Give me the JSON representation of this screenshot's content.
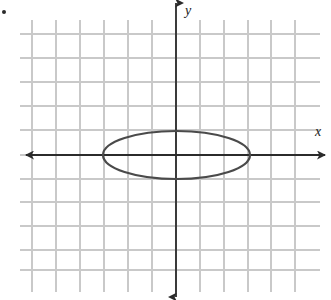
{
  "figure": {
    "kind": "coordinate-plane-with-conic",
    "bullet_marker": "•",
    "axis_labels": {
      "x": "x",
      "y": "y"
    },
    "colors": {
      "grid": "#c9c9c9",
      "axis": "#2b2b2b",
      "curve": "#4a4a4a",
      "background": "#ffffff",
      "label": "#1a1a1a"
    }
  },
  "chart_data": {
    "type": "scatter",
    "title": "",
    "subtitle": "",
    "xlabel": "x",
    "ylabel": "y",
    "grid": true,
    "legend": null,
    "grid_spacing_units": 1,
    "grid_spacing_px": 24,
    "origin_px": {
      "x": 176,
      "y": 155
    },
    "xlim": [
      -6,
      5
    ],
    "ylim": [
      -5,
      5
    ],
    "xticks": [
      -6,
      -5,
      -4,
      -3,
      -2,
      -1,
      0,
      1,
      2,
      3,
      4,
      5
    ],
    "yticks": [
      -5,
      -4,
      -3,
      -2,
      -1,
      0,
      1,
      2,
      3,
      4,
      5
    ],
    "xtick_labels": [],
    "ytick_labels": [],
    "axes": {
      "x_axis": {
        "y_px": 155,
        "x_start_px": 26,
        "x_end_px": 325,
        "arrows": "both"
      },
      "y_axis": {
        "x_px": 176,
        "y_start_px": 3,
        "y_end_px": 297,
        "arrows": "both"
      }
    },
    "grid_lines": {
      "vertical_px": [
        32,
        56,
        80,
        104,
        128,
        152,
        176,
        200,
        224,
        248,
        271,
        295
      ],
      "horizontal_px": [
        34,
        58,
        82,
        106,
        130,
        155,
        179,
        202,
        226,
        250,
        270
      ],
      "vertical_extent_px": [
        20,
        292
      ],
      "horizontal_extent_px": [
        20,
        320
      ]
    },
    "annotations": [
      {
        "type": "ellipse",
        "center": [
          0,
          0
        ],
        "center_px": [
          176.5,
          155
        ],
        "semi_major_axis_units": 3,
        "semi_minor_axis_units": 1,
        "semi_major_axis_px": 73.5,
        "semi_minor_axis_px": 24,
        "orientation": "horizontal",
        "vertices": [
          [
            -3,
            0
          ],
          [
            3,
            0
          ]
        ],
        "co_vertices": [
          [
            0,
            -1
          ],
          [
            0,
            1
          ]
        ],
        "equation": "x²/9 + y²/1 = 1",
        "stroke_width_px": 2.2
      }
    ]
  }
}
